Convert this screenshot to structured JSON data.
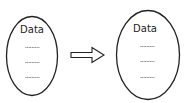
{
  "diagram": {
    "nodes": [
      {
        "id": "left",
        "title": "Data",
        "rows": [
          "·········",
          "·········",
          "·········"
        ]
      },
      {
        "id": "right",
        "title": "Data",
        "rows": [
          "·········",
          "·········",
          "·········"
        ]
      }
    ],
    "edges": [
      {
        "from": "left",
        "to": "right",
        "style": "hollow-block-arrow"
      }
    ],
    "colors": {
      "stroke": "#222222",
      "background": "#ffffff"
    }
  }
}
